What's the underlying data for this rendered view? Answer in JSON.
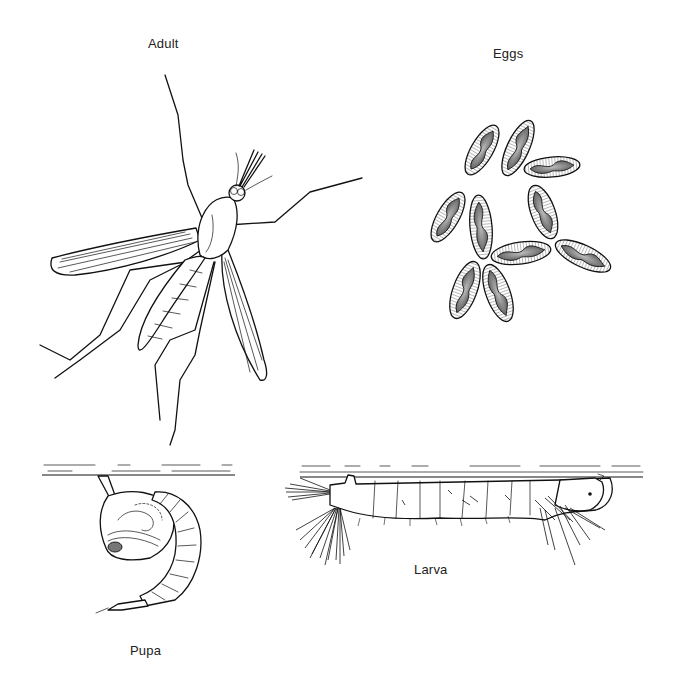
{
  "figure": {
    "stages": [
      {
        "id": "adult",
        "label": "Adult"
      },
      {
        "id": "eggs",
        "label": "Eggs"
      },
      {
        "id": "pupa",
        "label": "Pupa"
      },
      {
        "id": "larva",
        "label": "Larva"
      }
    ],
    "colors": {
      "ink": "#111111",
      "background": "#ffffff",
      "egg_fill": "#8a8a8a"
    }
  }
}
